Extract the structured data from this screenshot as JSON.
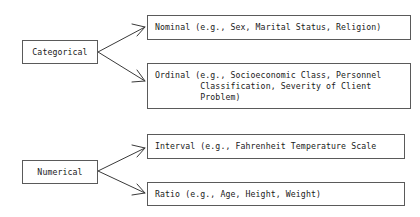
{
  "diagram": {
    "type": "classification-tree",
    "groups": [
      {
        "label": "Categorical",
        "children": [
          {
            "label": "Nominal (e.g., Sex, Marital Status, Religion)"
          },
          {
            "label": "Ordinal (e.g., Socioeconomic Class, Personnel\n         Classification, Severity of Client\n         Problem)"
          }
        ]
      },
      {
        "label": "Numerical",
        "children": [
          {
            "label": "Interval (e.g., Fahrenheit Temperature Scale"
          },
          {
            "label": "Ratio (e.g., Age, Height, Weight)"
          }
        ]
      }
    ],
    "colors": {
      "line": "#3a3a3a",
      "border": "#5a5a5a",
      "text": "#1a1a1a",
      "background": "#ffffff"
    }
  }
}
